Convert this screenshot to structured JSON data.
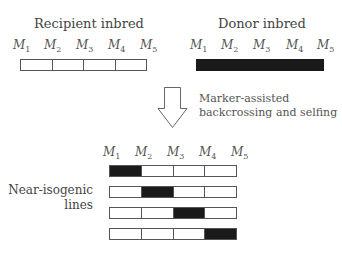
{
  "recipient": {
    "title": "Recipient inbred",
    "markers": [
      "M",
      "M",
      "M",
      "M",
      "M"
    ],
    "marker_subs": [
      "1",
      "2",
      "3",
      "4",
      "5"
    ],
    "segments": [
      "recipient",
      "recipient",
      "recipient",
      "recipient"
    ]
  },
  "donor": {
    "title": "Donor inbred",
    "markers": [
      "M",
      "M",
      "M",
      "M",
      "M"
    ],
    "marker_subs": [
      "1",
      "2",
      "3",
      "4",
      "5"
    ],
    "fill": "solid"
  },
  "arrow": {
    "caption_line1": "Marker-assisted",
    "caption_line2": "backcrossing and selfing"
  },
  "nil": {
    "label_line1": "Near-isogenic",
    "label_line2": "lines",
    "markers": [
      "M",
      "M",
      "M",
      "M",
      "M"
    ],
    "marker_subs": [
      "1",
      "2",
      "3",
      "4",
      "5"
    ],
    "rows": [
      {
        "donor_segment": 1
      },
      {
        "donor_segment": 2
      },
      {
        "donor_segment": 3
      },
      {
        "donor_segment": 4
      }
    ]
  },
  "colors": {
    "donor": "#1a1a1a",
    "recipient": "#ffffff",
    "outline": "#555555"
  }
}
